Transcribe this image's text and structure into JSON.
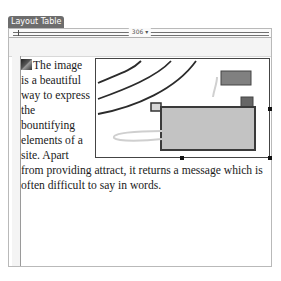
{
  "panel": {
    "tab_label": "Layout Table",
    "ruler_width": "306 ▾"
  },
  "content": {
    "image_icon": "image-placeholder-icon",
    "paragraph": "The image is a beautiful way to express the bountifying elements of a site. Apart from providing attract, it returns a message which is often difficult to say in words."
  },
  "illustration": {
    "colors": {
      "outline": "#3a3a3a",
      "box_fill": "#c3c3c3",
      "small_box_fill": "#808080",
      "curve": "#cfcfcf"
    }
  }
}
